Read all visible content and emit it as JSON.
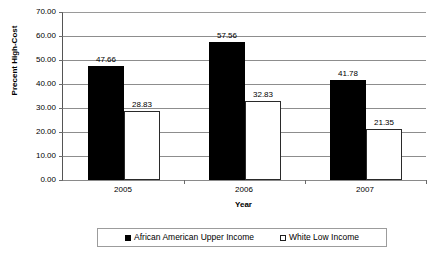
{
  "chart_data": {
    "type": "bar",
    "title": "",
    "xlabel": "Year",
    "ylabel": "Precent High-Cost",
    "categories": [
      "2005",
      "2006",
      "2007"
    ],
    "ylim": [
      0,
      70
    ],
    "ytick_step": 10,
    "ytick_labels": [
      "70.00",
      "60.00",
      "50.00",
      "40.00",
      "30.00",
      "20.00",
      "10.00",
      "0.00"
    ],
    "ytick_values": [
      70,
      60,
      50,
      40,
      30,
      20,
      10,
      0
    ],
    "grid": true,
    "legend_position": "bottom",
    "series": [
      {
        "name": "African American Upper Income",
        "color": "#000000",
        "swatch": "filled",
        "values": [
          47.66,
          57.56,
          41.78
        ],
        "labels": [
          "47.66",
          "57.56",
          "41.78"
        ]
      },
      {
        "name": "White Low Income",
        "color": "#ffffff",
        "swatch": "hollow",
        "values": [
          28.83,
          32.83,
          21.35
        ],
        "labels": [
          "28.83",
          "32.83",
          "21.35"
        ]
      }
    ]
  },
  "legend": {
    "items": [
      {
        "label": "African American Upper Income",
        "swatch": "filled"
      },
      {
        "label": "White Low Income",
        "swatch": "hollow"
      }
    ]
  }
}
